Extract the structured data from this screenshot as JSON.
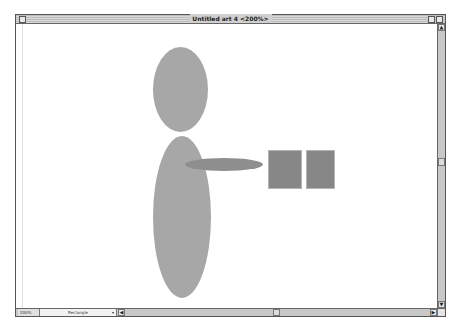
{
  "window": {
    "title": "Untitled art 4 <200%>"
  },
  "statusbar": {
    "zoom_level": "200%",
    "current_tool": "Rectangle",
    "tool_dropdown_arrow": "▾"
  },
  "scrollbars": {
    "up_arrow": "▲",
    "down_arrow": "▼",
    "left_arrow": "◀",
    "right_arrow": "▶"
  },
  "artwork": {
    "shapes": [
      {
        "name": "head-ellipse",
        "type": "ellipse",
        "x": 137,
        "y": 23,
        "w": 55,
        "h": 85,
        "color": "#a7a7a7"
      },
      {
        "name": "body-ellipse",
        "type": "ellipse",
        "x": 137,
        "y": 112,
        "w": 58,
        "h": 162,
        "color": "#a7a7a7"
      },
      {
        "name": "arm-ellipse",
        "type": "ellipse",
        "x": 169,
        "y": 134,
        "w": 78,
        "h": 13,
        "color": "#8e8e8e"
      },
      {
        "name": "square-left",
        "type": "rect",
        "x": 252,
        "y": 126,
        "w": 34,
        "h": 39,
        "color": "#878787"
      },
      {
        "name": "square-right",
        "type": "rect",
        "x": 290,
        "y": 126,
        "w": 29,
        "h": 39,
        "color": "#878787"
      }
    ]
  }
}
